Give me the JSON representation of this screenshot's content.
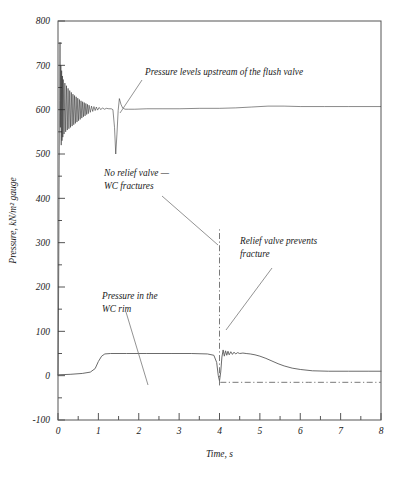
{
  "chart_data": {
    "type": "line",
    "title": "",
    "xlabel": "Time, s",
    "ylabel": "Pressure, kN/m² gauge",
    "xlim": [
      0,
      8
    ],
    "ylim": [
      -100,
      800
    ],
    "xticks": [
      0,
      1,
      2,
      3,
      4,
      5,
      6,
      7,
      8
    ],
    "xtick_labels": [
      "0",
      "1",
      "2",
      "3",
      "4",
      "5",
      "6",
      "7",
      "8"
    ],
    "xminor_ticks": [
      0.5,
      1.5,
      2.5,
      3.5,
      4.5,
      5.5,
      6.5,
      7.5
    ],
    "yticks": [
      -100,
      0,
      100,
      200,
      300,
      400,
      500,
      600,
      700,
      800
    ],
    "ytick_labels": [
      "-100",
      "0",
      "100",
      "200",
      "300",
      "400",
      "500",
      "600",
      "700",
      "800"
    ],
    "yminor_ticks": [
      -50,
      50,
      150,
      250,
      350,
      450,
      550,
      650,
      750
    ],
    "grid": false,
    "legend": "none",
    "series": [
      {
        "name": "Pressure levels upstream of the flush valve",
        "style": "solid-oscillating",
        "color": "#2a2a2a",
        "points": [
          [
            0.0,
            0
          ],
          [
            0.02,
            250
          ],
          [
            0.04,
            620
          ],
          [
            0.05,
            752
          ],
          [
            0.06,
            560
          ],
          [
            0.07,
            700
          ],
          [
            0.08,
            520
          ],
          [
            0.09,
            688
          ],
          [
            0.1,
            530
          ],
          [
            0.11,
            676
          ],
          [
            0.12,
            538
          ],
          [
            0.13,
            668
          ],
          [
            0.15,
            545
          ],
          [
            0.17,
            660
          ],
          [
            0.19,
            550
          ],
          [
            0.21,
            654
          ],
          [
            0.23,
            554
          ],
          [
            0.25,
            648
          ],
          [
            0.27,
            557
          ],
          [
            0.29,
            643
          ],
          [
            0.31,
            560
          ],
          [
            0.33,
            639
          ],
          [
            0.35,
            563
          ],
          [
            0.37,
            635
          ],
          [
            0.39,
            566
          ],
          [
            0.41,
            632
          ],
          [
            0.43,
            569
          ],
          [
            0.45,
            629
          ],
          [
            0.47,
            572
          ],
          [
            0.49,
            626
          ],
          [
            0.51,
            575
          ],
          [
            0.53,
            623
          ],
          [
            0.55,
            578
          ],
          [
            0.57,
            620
          ],
          [
            0.59,
            581
          ],
          [
            0.61,
            618
          ],
          [
            0.63,
            584
          ],
          [
            0.65,
            616
          ],
          [
            0.67,
            586
          ],
          [
            0.69,
            614
          ],
          [
            0.71,
            589
          ],
          [
            0.73,
            612
          ],
          [
            0.75,
            591
          ],
          [
            0.77,
            610
          ],
          [
            0.8,
            594
          ],
          [
            0.83,
            608
          ],
          [
            0.86,
            596
          ],
          [
            0.89,
            607
          ],
          [
            0.92,
            598
          ],
          [
            0.95,
            606
          ],
          [
            0.98,
            599
          ],
          [
            1.02,
            605
          ],
          [
            1.06,
            600
          ],
          [
            1.1,
            604
          ],
          [
            1.15,
            601
          ],
          [
            1.2,
            603
          ],
          [
            1.26,
            602
          ],
          [
            1.32,
            602
          ],
          [
            1.36,
            600
          ],
          [
            1.4,
            560
          ],
          [
            1.43,
            500
          ],
          [
            1.46,
            545
          ],
          [
            1.49,
            598
          ],
          [
            1.52,
            625
          ],
          [
            1.56,
            612
          ],
          [
            1.6,
            604
          ],
          [
            1.66,
            601
          ],
          [
            1.75,
            601
          ],
          [
            1.9,
            601
          ],
          [
            2.2,
            602
          ],
          [
            2.6,
            602
          ],
          [
            3.0,
            602
          ],
          [
            3.5,
            603
          ],
          [
            4.0,
            603
          ],
          [
            4.4,
            604
          ],
          [
            4.8,
            606
          ],
          [
            5.2,
            608
          ],
          [
            5.6,
            608
          ],
          [
            6.0,
            607
          ],
          [
            6.6,
            607
          ],
          [
            7.2,
            607
          ],
          [
            8.0,
            607
          ]
        ]
      },
      {
        "name": "Pressure in the WC rim",
        "style": "solid",
        "color": "#5a5a5a",
        "points": [
          [
            0.0,
            2
          ],
          [
            0.3,
            3
          ],
          [
            0.6,
            5
          ],
          [
            0.8,
            8
          ],
          [
            0.92,
            16
          ],
          [
            1.0,
            32
          ],
          [
            1.08,
            44
          ],
          [
            1.16,
            49
          ],
          [
            1.3,
            50
          ],
          [
            1.7,
            50
          ],
          [
            2.2,
            50
          ],
          [
            2.8,
            50
          ],
          [
            3.3,
            50
          ],
          [
            3.7,
            49
          ],
          [
            3.86,
            46
          ],
          [
            3.93,
            30
          ],
          [
            3.97,
            0
          ],
          [
            4.0,
            -12
          ],
          [
            4.03,
            8
          ],
          [
            4.06,
            42
          ],
          [
            4.09,
            58
          ],
          [
            4.12,
            44
          ],
          [
            4.15,
            56
          ],
          [
            4.18,
            46
          ],
          [
            4.21,
            55
          ],
          [
            4.24,
            47
          ],
          [
            4.28,
            54
          ],
          [
            4.32,
            48
          ],
          [
            4.36,
            53
          ],
          [
            4.4,
            49
          ],
          [
            4.45,
            52
          ],
          [
            4.5,
            50
          ],
          [
            4.58,
            51
          ],
          [
            4.66,
            50
          ],
          [
            4.76,
            49
          ],
          [
            4.88,
            47
          ],
          [
            5.0,
            44
          ],
          [
            5.15,
            39
          ],
          [
            5.3,
            33
          ],
          [
            5.45,
            27
          ],
          [
            5.6,
            22
          ],
          [
            5.8,
            17
          ],
          [
            6.0,
            14
          ],
          [
            6.3,
            11
          ],
          [
            6.7,
            10
          ],
          [
            7.2,
            10
          ],
          [
            7.7,
            10
          ],
          [
            8.0,
            10
          ]
        ]
      },
      {
        "name": "Relief valve prevents fracture",
        "style": "dash-dot",
        "color": "#6a6a6a",
        "points": [
          [
            4.02,
            -15
          ],
          [
            4.6,
            -15
          ],
          [
            5.4,
            -15
          ],
          [
            6.2,
            -15
          ],
          [
            7.0,
            -15
          ],
          [
            7.7,
            -15
          ],
          [
            8.0,
            -15
          ]
        ]
      }
    ],
    "vertical_markers": [
      {
        "name": "wc-fracture-marker",
        "x": 4.0,
        "y_from": -22,
        "y_to": 330,
        "style": "dash-dot"
      }
    ],
    "annotations": [
      {
        "id": "annot-flush-valve",
        "lines": [
          "Pressure levels upstream of the flush valve"
        ],
        "text_x": 145,
        "text_y": 75,
        "leader": [
          [
            142,
            80
          ],
          [
            120,
            113
          ]
        ]
      },
      {
        "id": "annot-no-relief",
        "lines": [
          "No relief valve —",
          "WC fractures"
        ],
        "text_x": 104,
        "text_y": 176,
        "leader": [
          [
            162,
            196
          ],
          [
            218,
            245
          ]
        ]
      },
      {
        "id": "annot-relief-prevents",
        "lines": [
          "Relief valve prevents",
          "fracture"
        ],
        "text_x": 240,
        "text_y": 244,
        "leader": [
          [
            272,
            268
          ],
          [
            226,
            330
          ]
        ]
      },
      {
        "id": "annot-wc-rim",
        "lines": [
          "Pressure in the",
          "WC rim"
        ],
        "text_x": 102,
        "text_y": 299,
        "leader": [
          [
            126,
            312
          ],
          [
            148,
            385
          ]
        ]
      }
    ]
  }
}
